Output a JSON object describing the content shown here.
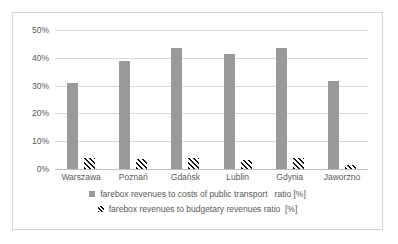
{
  "chart_data": {
    "type": "bar",
    "title": "",
    "subtitle": "",
    "xlabel": "",
    "ylabel": "",
    "categories": [
      "Warszawa",
      "Poznań",
      "Gdańsk",
      "Lublin",
      "Gdynia",
      "Jaworzno"
    ],
    "series": [
      {
        "name": "farebox revenues to costs of public transport   ratio [%]",
        "values": [
          30.8,
          38.8,
          43.5,
          41.3,
          43.5,
          31.7
        ],
        "color": "#9a9a9a",
        "fill": "solid"
      },
      {
        "name": "farebox revenues to budgetary revenues ratio  [%]",
        "values": [
          4.0,
          3.5,
          3.8,
          3.3,
          3.9,
          1.5
        ],
        "color": "#111111",
        "fill": "diagonal-hatch"
      }
    ],
    "ylim": [
      0,
      50
    ],
    "ytick_values": [
      0,
      10,
      20,
      30,
      40,
      50
    ],
    "ytick_labels": [
      "0%",
      "10%",
      "20%",
      "30%",
      "40%",
      "50%"
    ],
    "grid": true,
    "grid_axis": "y",
    "legend_position": "bottom"
  },
  "axis": {
    "y_labels": [
      "50%",
      "40%",
      "30%",
      "20%",
      "10%",
      "0%"
    ]
  },
  "legend": {
    "entries": [
      {
        "marker": "solid-gray-square-icon",
        "label": "farebox revenues to costs of public transport   ratio [%]"
      },
      {
        "marker": "hatched-square-icon",
        "label": "farebox revenues to budgetary revenues ratio  [%]"
      }
    ]
  }
}
